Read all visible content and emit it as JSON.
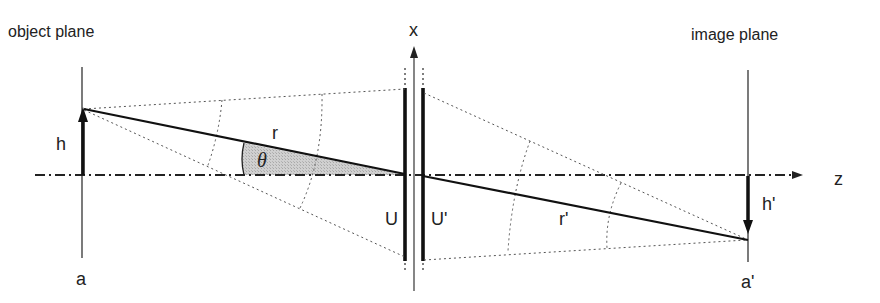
{
  "diagram": {
    "type": "optical-imaging-geometry",
    "labels": {
      "object_plane": "object plane",
      "image_plane": "image plane",
      "x_axis": "x",
      "z_axis": "z",
      "object_height": "h",
      "image_height": "h'",
      "object_point": "a",
      "image_point": "a'",
      "object_distance": "r",
      "image_distance": "r'",
      "angle": "θ",
      "principal_plane_front": "U",
      "principal_plane_back": "U'"
    },
    "colors": {
      "line": "#222222",
      "dotted": "#555555",
      "shade": "#c8c8c8"
    }
  }
}
